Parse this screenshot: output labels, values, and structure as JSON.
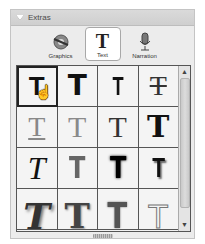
{
  "panel": {
    "title": "Extras",
    "tabs": [
      {
        "label": "Graphics",
        "icon": "graphics-icon",
        "active": false
      },
      {
        "label": "Text",
        "icon": "text-icon",
        "glyph": "T",
        "active": true
      },
      {
        "label": "Narration",
        "icon": "microphone-icon",
        "active": false
      }
    ]
  },
  "grid": {
    "columns": 4,
    "selected_index": 0,
    "items": [
      {
        "glyph": "T",
        "style": "sans-bold"
      },
      {
        "glyph": "T",
        "style": "sans-heavy"
      },
      {
        "glyph": "T",
        "style": "sans-condensed"
      },
      {
        "glyph": "T",
        "style": "strikethrough-serif"
      },
      {
        "glyph": "T",
        "style": "underline-gray"
      },
      {
        "glyph": "T",
        "style": "serif-gray"
      },
      {
        "glyph": "T",
        "style": "serif-dark"
      },
      {
        "glyph": "T",
        "style": "slab-heavy"
      },
      {
        "glyph": "T",
        "style": "italic-serif"
      },
      {
        "glyph": "T",
        "style": "gray-block"
      },
      {
        "glyph": "T",
        "style": "blur-black"
      },
      {
        "glyph": "T",
        "style": "shadow-black"
      },
      {
        "glyph": "T",
        "style": "italic-heavy-shadow"
      },
      {
        "glyph": "T",
        "style": "serif-shadow"
      },
      {
        "glyph": "T",
        "style": "gray-block-blur"
      },
      {
        "glyph": "T",
        "style": "thin-outline"
      }
    ]
  },
  "cursor": {
    "icon": "hand-pointer-icon",
    "glyph": "☝"
  },
  "scrollbar": {
    "up": "▲",
    "down": "▼"
  }
}
